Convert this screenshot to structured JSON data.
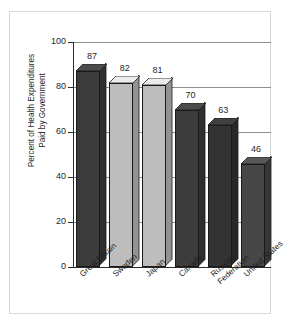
{
  "chart_data": {
    "type": "bar",
    "title": "",
    "subtitle": "",
    "xlabel": "",
    "ylabel": "Percent of Health Expenditures Paid by Government",
    "ylabel_lines": [
      "Percent of Health Expenditures",
      "Paid by Government"
    ],
    "categories": [
      "Great Britain",
      "Sweden",
      "Japan",
      "Canada",
      "Russian Federation",
      "United States"
    ],
    "category_lines": [
      [
        "Great Britain"
      ],
      [
        "Sweden"
      ],
      [
        "Japan"
      ],
      [
        "Canada"
      ],
      [
        "Russian",
        "Federation"
      ],
      [
        "United States"
      ]
    ],
    "values": [
      87,
      82,
      81,
      70,
      63,
      46
    ],
    "ylim": [
      0,
      100
    ],
    "yticks": [
      0,
      20,
      40,
      60,
      80,
      100
    ],
    "ytick_labels": [
      "0",
      "20",
      "40",
      "60",
      "80",
      "100"
    ],
    "grid": true,
    "legend": "none",
    "bar_colors": [
      "#3c3c3c",
      "#bdbdbd",
      "#bdbdbd",
      "#3c3c3c",
      "#333333",
      "#474747"
    ],
    "style": "3d-bars",
    "colors": {
      "gridline": "#8e8e8e",
      "axis": "#2b2b2b",
      "frame": "#d8d8d8",
      "background": "#ffffff",
      "text": "#1f1f1f"
    }
  }
}
